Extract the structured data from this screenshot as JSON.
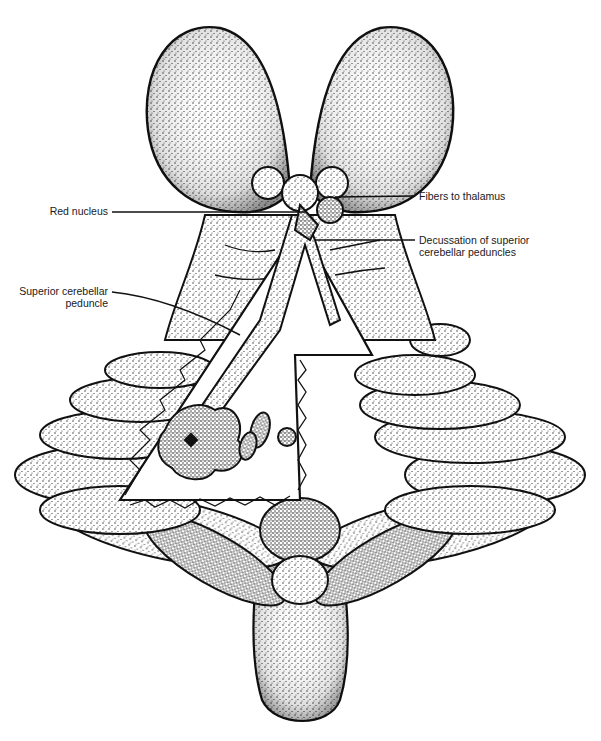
{
  "figure": {
    "style": "stippled black ink line drawing on white",
    "colors": {
      "ink": "#111111",
      "background": "#ffffff",
      "stipple_fill": "#e6e6e6"
    }
  },
  "labels": {
    "red_nucleus": "Red nucleus",
    "fibers_to_thalamus": "Fibers to thalamus",
    "decussation_line1": "Decussation of superior",
    "decussation_line2": "cerebellar peduncles",
    "superior_cerebellar_line1": "Superior cerebellar",
    "superior_cerebellar_line2": "peduncle"
  }
}
